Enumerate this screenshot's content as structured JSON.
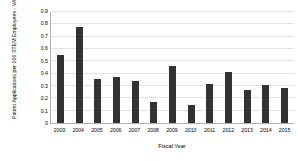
{
  "chart_data": {
    "type": "bar",
    "title": "",
    "xlabel": "Fiscal Year",
    "ylabel": "Patent Applications per 100 STEM Employees - VA",
    "categories": [
      "2003",
      "2004",
      "2005",
      "2006",
      "2007",
      "2008",
      "2009",
      "2010",
      "2011",
      "2012",
      "2013",
      "2014",
      "2015"
    ],
    "values": [
      0.55,
      0.78,
      0.36,
      0.37,
      0.34,
      0.17,
      0.46,
      0.15,
      0.32,
      0.41,
      0.27,
      0.31,
      0.28
    ],
    "ylim": [
      0,
      0.9
    ],
    "ytick_labels": [
      "0.9",
      "0.8",
      "0.7",
      "0.6",
      "0.5",
      "0.4",
      "0.3",
      "0.2",
      "0.1",
      "0"
    ],
    "ytick_values": [
      0.9,
      0.8,
      0.7,
      0.6,
      0.5,
      0.4,
      0.3,
      0.2,
      0.1,
      0
    ],
    "grid": true,
    "legend": false,
    "bar_color": "#333333",
    "grid_color": "#e2e2e2",
    "axis_color": "#b0b0b0",
    "background": "#ffffff"
  }
}
